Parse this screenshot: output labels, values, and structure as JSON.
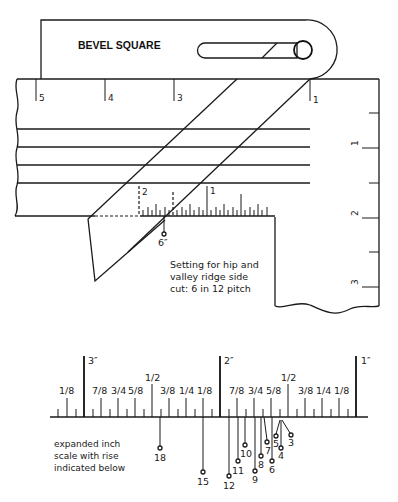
{
  "tool": {
    "title": "BEVEL SQUARE"
  },
  "top_blade_scale": {
    "labels": [
      "5",
      "4",
      "3",
      "1"
    ]
  },
  "right_scale": {
    "labels": [
      "1",
      "2",
      "3"
    ]
  },
  "sliding_blade_scale": {
    "labels": [
      "2",
      "1"
    ]
  },
  "setting_marker": {
    "label": "6″"
  },
  "caption": {
    "line1": "Setting for hip and",
    "line2": "valley ridge side",
    "line3": "cut: 6 in 12 pitch"
  },
  "expanded_scale": {
    "inch_labels": [
      "3″",
      "2″",
      "1″"
    ],
    "fraction_labels_left": [
      "1/8",
      "7/8",
      "3/4",
      "5/8",
      "1/2",
      "3/8",
      "1/4",
      "1/8"
    ],
    "fraction_labels_right": [
      "7/8",
      "3/4",
      "5/8",
      "1/2",
      "3/8",
      "1/4",
      "1/8"
    ],
    "note_line1": "expanded inch",
    "note_line2": "scale with rise",
    "note_line3": "indicated below",
    "rise_labels": [
      "18",
      "15",
      "12",
      "11",
      "10",
      "9",
      "8",
      "7",
      "6",
      "5",
      "4",
      "3"
    ]
  }
}
